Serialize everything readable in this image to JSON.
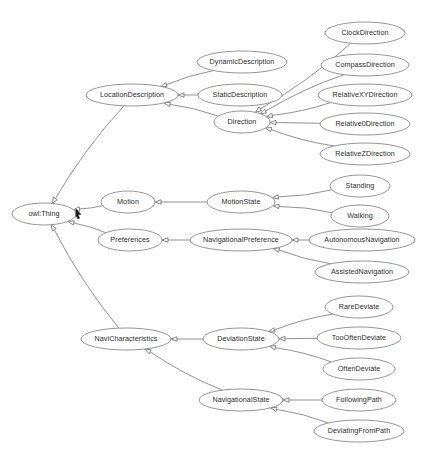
{
  "diagram": {
    "type": "owl-class-hierarchy",
    "background_color": "#ffffff",
    "node_fill_color": "#ffffff",
    "node_stroke_color": "#8a8a8a",
    "edge_color": "#7d7d7d",
    "label_color": "#2b2b2b",
    "relationship": "subClassOf",
    "arrow_style": "hollow-triangle",
    "nodes": [
      {
        "id": "owlThing",
        "label": "owl:Thing",
        "x": 44,
        "y": 214,
        "rx": 32,
        "ry": 11
      },
      {
        "id": "locationDescription",
        "label": "LocationDescription",
        "x": 132,
        "y": 95,
        "rx": 46,
        "ry": 11
      },
      {
        "id": "dynamicDescription",
        "label": "DynamicDescription",
        "x": 242,
        "y": 62,
        "rx": 45,
        "ry": 11
      },
      {
        "id": "staticDescription",
        "label": "StaticDescription",
        "x": 240,
        "y": 95,
        "rx": 42,
        "ry": 11
      },
      {
        "id": "direction",
        "label": "Direction",
        "x": 242,
        "y": 122,
        "rx": 28,
        "ry": 11
      },
      {
        "id": "clockDirection",
        "label": "ClockDirection",
        "x": 365,
        "y": 33,
        "rx": 40,
        "ry": 11
      },
      {
        "id": "compassDirection",
        "label": "CompassDirection",
        "x": 365,
        "y": 65,
        "rx": 44,
        "ry": 11
      },
      {
        "id": "relativeXYDirection",
        "label": "RelativeXYDirection",
        "x": 365,
        "y": 95,
        "rx": 47,
        "ry": 11
      },
      {
        "id": "relative0Direction",
        "label": "Relative0Direction",
        "x": 365,
        "y": 124,
        "rx": 45,
        "ry": 11
      },
      {
        "id": "relativeZDirection",
        "label": "RelativeZDirection",
        "x": 365,
        "y": 154,
        "rx": 45,
        "ry": 11
      },
      {
        "id": "motion",
        "label": "Motion",
        "x": 128,
        "y": 202,
        "rx": 27,
        "ry": 11
      },
      {
        "id": "motionState",
        "label": "MotionState",
        "x": 241,
        "y": 202,
        "rx": 34,
        "ry": 11
      },
      {
        "id": "standing",
        "label": "Standing",
        "x": 360,
        "y": 186,
        "rx": 30,
        "ry": 11
      },
      {
        "id": "walking",
        "label": "Walking",
        "x": 360,
        "y": 216,
        "rx": 29,
        "ry": 11
      },
      {
        "id": "preferences",
        "label": "Preferences",
        "x": 130,
        "y": 240,
        "rx": 32,
        "ry": 11
      },
      {
        "id": "navigationalPreference",
        "label": "NavigationalPreference",
        "x": 241,
        "y": 240,
        "rx": 51,
        "ry": 11
      },
      {
        "id": "autonomousNavigation",
        "label": "AutonomousNavigation",
        "x": 362,
        "y": 240,
        "rx": 53,
        "ry": 11
      },
      {
        "id": "assistedNavigation",
        "label": "AssistedNavigation",
        "x": 362,
        "y": 272,
        "rx": 47,
        "ry": 11
      },
      {
        "id": "naviCharacteristics",
        "label": "NaviCharacteristics",
        "x": 126,
        "y": 339,
        "rx": 45,
        "ry": 11
      },
      {
        "id": "deviationState",
        "label": "DeviationState",
        "x": 241,
        "y": 339,
        "rx": 38,
        "ry": 11
      },
      {
        "id": "rareDeviate",
        "label": "RareDeviate",
        "x": 359,
        "y": 307,
        "rx": 34,
        "ry": 11
      },
      {
        "id": "tooOftenDeviate",
        "label": "TooOftenDeviate",
        "x": 359,
        "y": 338,
        "rx": 42,
        "ry": 11
      },
      {
        "id": "oftenDeviate",
        "label": "OftenDeviate",
        "x": 359,
        "y": 369,
        "rx": 36,
        "ry": 11
      },
      {
        "id": "navigationalState",
        "label": "NavigationalState",
        "x": 241,
        "y": 400,
        "rx": 42,
        "ry": 11
      },
      {
        "id": "followingPath",
        "label": "FollowingPath",
        "x": 359,
        "y": 400,
        "rx": 37,
        "ry": 11
      },
      {
        "id": "deviatingFromPath",
        "label": "DeviatingFromPath",
        "x": 359,
        "y": 431,
        "rx": 45,
        "ry": 11
      }
    ],
    "edges": [
      {
        "from": "locationDescription",
        "to": "owlThing"
      },
      {
        "from": "motion",
        "to": "owlThing"
      },
      {
        "from": "preferences",
        "to": "owlThing"
      },
      {
        "from": "naviCharacteristics",
        "to": "owlThing"
      },
      {
        "from": "dynamicDescription",
        "to": "locationDescription"
      },
      {
        "from": "staticDescription",
        "to": "locationDescription"
      },
      {
        "from": "direction",
        "to": "locationDescription"
      },
      {
        "from": "clockDirection",
        "to": "direction"
      },
      {
        "from": "compassDirection",
        "to": "direction"
      },
      {
        "from": "relativeXYDirection",
        "to": "direction"
      },
      {
        "from": "relative0Direction",
        "to": "direction"
      },
      {
        "from": "relativeZDirection",
        "to": "direction"
      },
      {
        "from": "motionState",
        "to": "motion"
      },
      {
        "from": "standing",
        "to": "motionState"
      },
      {
        "from": "walking",
        "to": "motionState"
      },
      {
        "from": "navigationalPreference",
        "to": "preferences"
      },
      {
        "from": "autonomousNavigation",
        "to": "navigationalPreference"
      },
      {
        "from": "assistedNavigation",
        "to": "navigationalPreference"
      },
      {
        "from": "deviationState",
        "to": "naviCharacteristics"
      },
      {
        "from": "navigationalState",
        "to": "naviCharacteristics"
      },
      {
        "from": "rareDeviate",
        "to": "deviationState"
      },
      {
        "from": "tooOftenDeviate",
        "to": "deviationState"
      },
      {
        "from": "oftenDeviate",
        "to": "deviationState"
      },
      {
        "from": "followingPath",
        "to": "navigationalState"
      },
      {
        "from": "deviatingFromPath",
        "to": "navigationalState"
      }
    ],
    "cursor": {
      "x": 76,
      "y": 214,
      "label": "mouse-pointer"
    }
  }
}
